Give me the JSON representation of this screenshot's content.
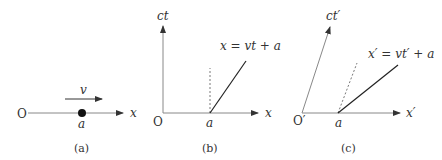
{
  "panels": {
    "a": {
      "caption": "(a)",
      "origin_label": "O",
      "axis_label": "x",
      "point_label": "a",
      "velocity_label": "v"
    },
    "b": {
      "caption": "(b)",
      "origin_label": "O",
      "x_axis_label": "x",
      "y_axis_label": "ct",
      "point_label": "a",
      "worldline_label": "x = vt + a"
    },
    "c": {
      "caption": "(c)",
      "origin_label": "O′",
      "x_axis_label": "x′",
      "y_axis_label": "ct′",
      "point_label": "a",
      "worldline_label": "x′ = vt′ + a"
    }
  },
  "colors": {
    "axis": "#888888",
    "worldline": "#222222",
    "text": "#333333"
  }
}
